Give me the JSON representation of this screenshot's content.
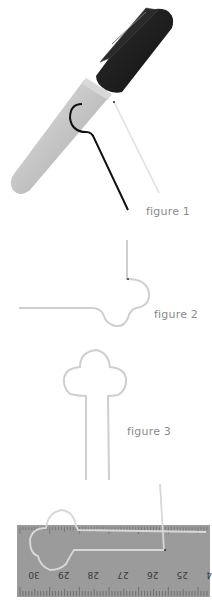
{
  "figures": [
    {
      "id": "figure-1",
      "caption": "figure 1",
      "description": "marker pen with wire bent around barrel"
    },
    {
      "id": "figure-2",
      "caption": "figure 2",
      "description": "wire with single loop bend"
    },
    {
      "id": "figure-3",
      "caption": "figure 3",
      "description": "wire bent into clover-shaped key loop"
    },
    {
      "id": "figure-4",
      "caption": "",
      "description": "finished wire shape laid on ruler"
    }
  ],
  "ruler": {
    "labels": [
      "30",
      "29",
      "28",
      "27",
      "26",
      "25",
      "24"
    ]
  },
  "colors": {
    "wire_gray": "#cfcfcf",
    "wire_black": "#1a1a1a",
    "marker_cap": "#1e1e1e",
    "marker_body": "#bdbdbd",
    "ruler": "#9a9a9a",
    "caption": "#8a8a8a"
  }
}
